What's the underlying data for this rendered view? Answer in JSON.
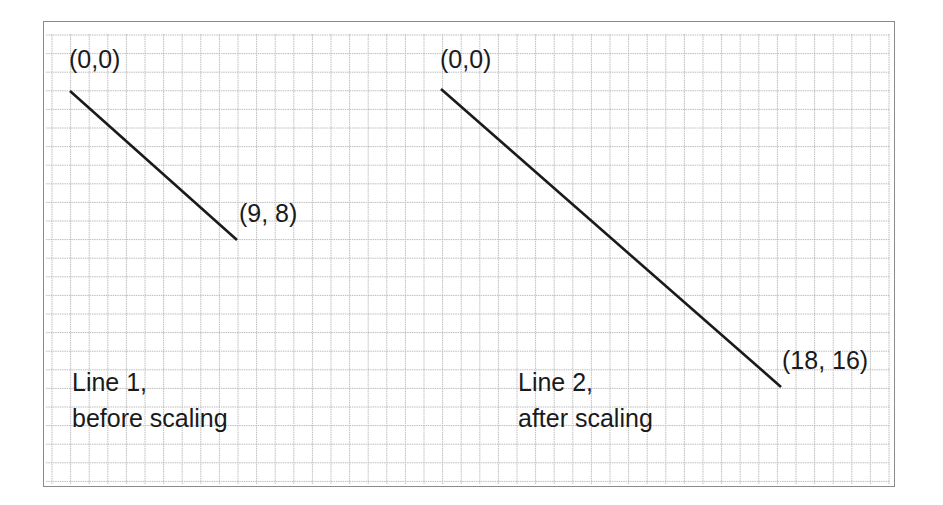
{
  "diagram": {
    "grid_color": "#bdbdbd",
    "line_color": "#1a1a1a",
    "lines": [
      {
        "name": "Line 1",
        "start_label": "(0,0)",
        "end_label": "(9, 8)",
        "caption_line1": "Line 1,",
        "caption_line2": "before scaling",
        "start": [
          0,
          0
        ],
        "end": [
          9,
          8
        ]
      },
      {
        "name": "Line 2",
        "start_label": "(0,0)",
        "end_label": "(18, 16)",
        "caption_line1": "Line 2,",
        "caption_line2": "after scaling",
        "start": [
          0,
          0
        ],
        "end": [
          18,
          16
        ]
      }
    ],
    "scale_factor": 2
  }
}
